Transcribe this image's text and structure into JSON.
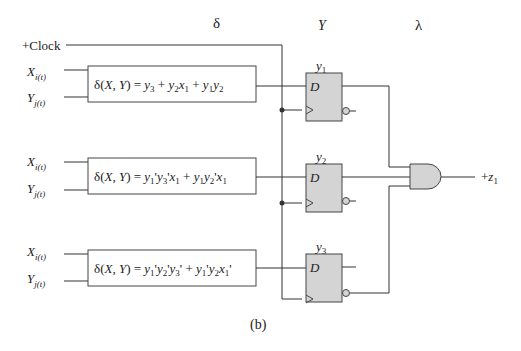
{
  "headers": {
    "delta": "δ",
    "y": "Y",
    "lambda": "λ"
  },
  "clock_label": "+Clock",
  "inputs": {
    "x_base": "X",
    "x_sub": "i(t)",
    "y_base": "Y",
    "y_sub": "j(t)"
  },
  "blocks": [
    {
      "expr_prefix": "δ(X, Y) = ",
      "expr": "y3 + y2x1 + y1y2"
    },
    {
      "expr_prefix": "δ(X, Y) = ",
      "expr": "y1'y3'x1 + y1y2'x1"
    },
    {
      "expr_prefix": "δ(X, Y) = ",
      "expr": "y1'y2'y3' + y1'y2x1'"
    }
  ],
  "flipflops": [
    {
      "label": "y",
      "sub": "1",
      "d": "D"
    },
    {
      "label": "y",
      "sub": "2",
      "d": "D"
    },
    {
      "label": "y",
      "sub": "3",
      "d": "D"
    }
  ],
  "output": {
    "prefix": "+z",
    "sub": "1"
  },
  "caption": "(b)",
  "colors": {
    "line": "#333333",
    "ff_fill": "#d4d4d4",
    "box_border": "#444444"
  }
}
